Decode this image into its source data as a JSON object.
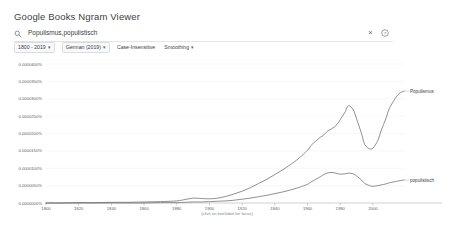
{
  "header": {
    "title": "Google Books Ngram Viewer"
  },
  "search": {
    "icon": "search-icon",
    "value": "Populismus,populistisch",
    "placeholder": "Search in Google Books Ngram Viewer",
    "clear_label": "×",
    "help_icon": "help-circle-icon"
  },
  "toolbar": {
    "date_range": "1800 - 2019",
    "corpus": "German (2019)",
    "case_insensitive": "Case-Insensitive",
    "smoothing": "Smoothing",
    "caret": "▾"
  },
  "chart_caption": "(click on line/label for focus)",
  "colors": {
    "series_populismus": "#6b6b6b",
    "series_populistisch": "#6b6b6b",
    "grid": "#e8eaed",
    "axis": "#9aa0a6",
    "text": "#3c4043"
  },
  "chart_data": {
    "type": "line",
    "title": "",
    "xlabel": "",
    "ylabel": "",
    "xlim": [
      1800,
      2019
    ],
    "ylim": [
      0.0,
      4e-05
    ],
    "grid": true,
    "legend": "inline-right-labels",
    "xticks": [
      1800,
      1820,
      1840,
      1860,
      1880,
      1900,
      1920,
      1940,
      1960,
      1980,
      2000
    ],
    "xtick_labels": [
      "1800",
      "1820",
      "1840",
      "1860",
      "1880",
      "1900",
      "1920",
      "1940",
      "1960",
      "1980",
      "2000"
    ],
    "yticks": [
      0.0,
      5e-06,
      1e-05,
      1.5e-05,
      2e-05,
      2.5e-05,
      3e-05,
      3.5e-05,
      4e-05
    ],
    "ytick_labels": [
      "0.0000000%",
      "0.0000050%",
      "0.0000100%",
      "0.0000150%",
      "0.0000200%",
      "0.0000250%",
      "0.0000300%",
      "0.0000350%",
      "0.0000400%"
    ],
    "x": [
      1800,
      1810,
      1820,
      1830,
      1840,
      1850,
      1860,
      1870,
      1880,
      1885,
      1890,
      1895,
      1900,
      1905,
      1910,
      1915,
      1920,
      1925,
      1930,
      1935,
      1940,
      1945,
      1950,
      1955,
      1960,
      1962,
      1965,
      1968,
      1970,
      1972,
      1975,
      1978,
      1980,
      1983,
      1985,
      1988,
      1990,
      1993,
      1995,
      1998,
      2000,
      2003,
      2005,
      2008,
      2010,
      2013,
      2015,
      2017,
      2019
    ],
    "series": [
      {
        "name": "Populismus",
        "label": "Populismus",
        "color": "#6b6b6b",
        "values": [
          0.0,
          0.0,
          1e-07,
          1e-07,
          2e-07,
          2e-07,
          3e-07,
          4e-07,
          6e-07,
          1e-06,
          1.4e-06,
          1.3e-06,
          1.2e-06,
          1.4e-06,
          1.9e-06,
          2.6e-06,
          3.4e-06,
          4.4e-06,
          5.6e-06,
          6.8e-06,
          8.2e-06,
          9.6e-06,
          1.12e-05,
          1.3e-05,
          1.52e-05,
          1.65e-05,
          1.78e-05,
          1.9e-05,
          1.96e-05,
          2.06e-05,
          2.14e-05,
          2.26e-05,
          2.4e-05,
          2.62e-05,
          2.8e-05,
          2.68e-05,
          2.42e-05,
          2e-05,
          1.68e-05,
          1.56e-05,
          1.58e-05,
          1.8e-05,
          2.08e-05,
          2.44e-05,
          2.72e-05,
          2.96e-05,
          3.1e-05,
          3.18e-05,
          3.22e-05
        ]
      },
      {
        "name": "populistisch",
        "label": "populistisch",
        "color": "#6b6b6b",
        "values": [
          0.0,
          0.0,
          0.0,
          0.0,
          0.0,
          0.0,
          0.0,
          1e-07,
          1e-07,
          2e-07,
          3e-07,
          3e-07,
          4e-07,
          5e-07,
          6e-07,
          8e-07,
          1.1e-06,
          1.4e-06,
          1.8e-06,
          2.2e-06,
          2.7e-06,
          3.2e-06,
          3.8e-06,
          4.5e-06,
          5.4e-06,
          6e-06,
          6.8e-06,
          7.6e-06,
          8.2e-06,
          8.6e-06,
          8.8e-06,
          8.5e-06,
          8.3e-06,
          8.4e-06,
          8.6e-06,
          8.4e-06,
          7.8e-06,
          6.6e-06,
          5.6e-06,
          5e-06,
          4.8e-06,
          5e-06,
          5.2e-06,
          5.5e-06,
          5.8e-06,
          6.1e-06,
          6.3e-06,
          6.5e-06,
          6.6e-06
        ]
      }
    ]
  }
}
